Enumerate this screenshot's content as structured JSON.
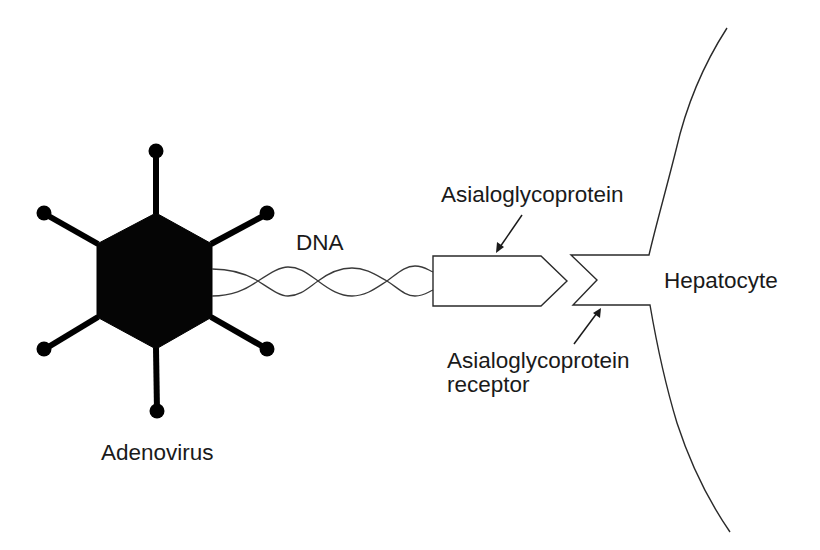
{
  "diagram": {
    "labels": {
      "adenovirus": "Adenovirus",
      "dna": "DNA",
      "ligand": "Asialoglycoprotein",
      "receptor_line1": "Asialoglycoprotein",
      "receptor_line2": "receptor",
      "cell": "Hepatocyte"
    },
    "components": [
      {
        "id": "adenovirus",
        "shape": "filled hexagon with 6 knobbed fibers",
        "color": "#000000"
      },
      {
        "id": "dna",
        "shape": "twisted double strand"
      },
      {
        "id": "asialoglycoprotein",
        "shape": "pentagon arrow block"
      },
      {
        "id": "asialoglycoprotein-receptor",
        "shape": "V-notch in cell membrane"
      },
      {
        "id": "hepatocyte",
        "shape": "curved cell membrane"
      }
    ],
    "connections": [
      {
        "from": "adenovirus",
        "to": "dna"
      },
      {
        "from": "dna",
        "to": "asialoglycoprotein"
      },
      {
        "from": "asialoglycoprotein",
        "to": "asialoglycoprotein-receptor",
        "relation": "binds"
      }
    ],
    "colors": {
      "background": "#ffffff",
      "ink": "#000000",
      "line": "#2a2a2a"
    }
  }
}
